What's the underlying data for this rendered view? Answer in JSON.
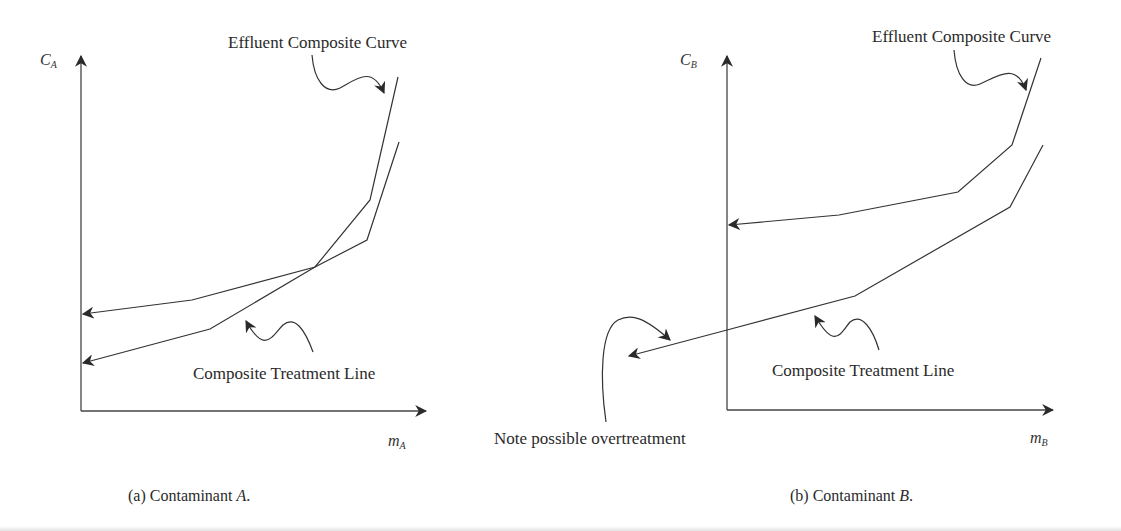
{
  "figure": {
    "panels": [
      {
        "id": "a",
        "y_axis_label": {
          "symbol": "C",
          "subscript": "A"
        },
        "x_axis_label": {
          "symbol": "m",
          "subscript": "A"
        },
        "effluent_label": "Effluent Composite Curve",
        "treatment_label": "Composite Treatment Line",
        "caption_prefix": "(a) Contaminant ",
        "caption_var": "A",
        "caption_suffix": "."
      },
      {
        "id": "b",
        "y_axis_label": {
          "symbol": "C",
          "subscript": "B"
        },
        "x_axis_label": {
          "symbol": "m",
          "subscript": "B"
        },
        "effluent_label": "Effluent Composite Curve",
        "treatment_label": "Composite Treatment Line",
        "note_label": "Note possible overtreatment",
        "caption_prefix": "(b) Contaminant ",
        "caption_var": "B",
        "caption_suffix": "."
      }
    ],
    "colors": {
      "line": "#333333",
      "background": "#ffffff"
    }
  }
}
